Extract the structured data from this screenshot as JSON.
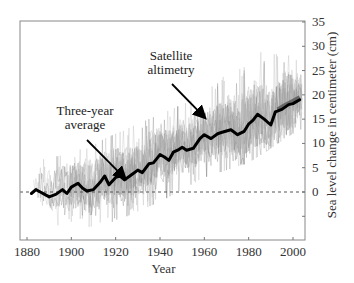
{
  "chart_data": {
    "type": "line",
    "title": "",
    "xlabel": "Year",
    "ylabel": "Sea level change in centimeter (cm)",
    "y_axis_side": "right",
    "xlim": [
      1878,
      2005
    ],
    "ylim": [
      -10,
      35
    ],
    "x_ticks": [
      1880,
      1900,
      1920,
      1940,
      1960,
      1980,
      2000
    ],
    "y_ticks": [
      0,
      5,
      10,
      15,
      20,
      25,
      30,
      35
    ],
    "y_minor_ticks": [
      -5
    ],
    "grid": false,
    "reference_line": {
      "y": 0,
      "style": "dashed"
    },
    "annotations": [
      {
        "text_lines": [
          "Three-year",
          "average"
        ],
        "arrow_to": {
          "x": 1924,
          "y": 2.5
        }
      },
      {
        "text_lines": [
          "Satellite",
          "altimetry"
        ],
        "arrow_to": {
          "x": 1960,
          "y": 15
        }
      }
    ],
    "series": [
      {
        "name": "Three-year average",
        "style": "thick black line",
        "x": [
          1882,
          1884,
          1886,
          1888,
          1890,
          1893,
          1896,
          1898,
          1900,
          1903,
          1905,
          1907,
          1910,
          1913,
          1915,
          1917,
          1920,
          1922,
          1924,
          1927,
          1930,
          1932,
          1935,
          1937,
          1940,
          1942,
          1944,
          1946,
          1948,
          1950,
          1952,
          1955,
          1958,
          1960,
          1963,
          1966,
          1968,
          1972,
          1975,
          1978,
          1980,
          1982,
          1984,
          1987,
          1990,
          1992,
          1995,
          1998,
          2000,
          2003
        ],
        "values": [
          -0.3,
          0.5,
          0,
          -0.5,
          -1,
          -0.5,
          0.5,
          -0.3,
          1,
          1.8,
          0.8,
          0.2,
          0.5,
          2,
          3.3,
          1.5,
          3,
          3.3,
          2.5,
          3.5,
          4.5,
          4,
          5.8,
          6,
          7.7,
          7.2,
          6.5,
          8.2,
          8.6,
          9.2,
          8.6,
          9,
          11,
          11.8,
          11,
          12,
          12.3,
          12.8,
          11.8,
          12.5,
          14,
          14.8,
          16,
          15,
          13.8,
          16.5,
          17,
          18,
          18.2,
          19
        ]
      },
      {
        "name": "Tide gauge records (individual)",
        "style": "thin light gray lines",
        "approx_envelope": {
          "x": [
            1880,
            1900,
            1920,
            1940,
            1960,
            1980,
            2000,
            2004
          ],
          "lower": [
            -7,
            -8,
            -6,
            -2,
            3,
            6,
            12,
            13
          ],
          "upper": [
            6,
            8,
            12,
            16,
            20,
            30,
            31,
            25
          ]
        }
      },
      {
        "name": "Satellite altimetry",
        "style": "dark gray band near end",
        "x": [
          1993,
          1996,
          1999,
          2003
        ],
        "values": [
          17,
          17.8,
          18.5,
          19.5
        ]
      }
    ]
  }
}
